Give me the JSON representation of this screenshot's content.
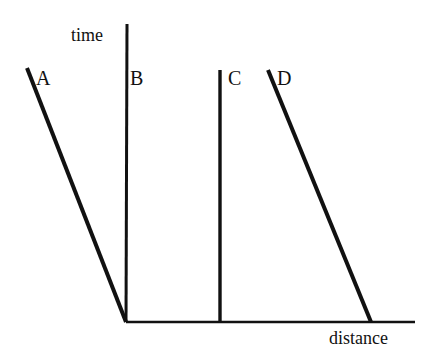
{
  "figure": {
    "background_color": "#ffffff",
    "stroke_color": "#111111",
    "width": 437,
    "height": 363
  },
  "axes": {
    "y_axis_label": "time",
    "x_axis_label": "distance"
  },
  "line_labels": {
    "a": "A",
    "b": "B",
    "c": "C",
    "d": "D"
  },
  "chart_data": {
    "type": "line",
    "title": "",
    "xlabel": "distance",
    "ylabel": "time",
    "grid": false,
    "legend": "inline-endpoint-labels",
    "axis_origin_px": [
      126,
      322
    ],
    "y_axis_top_px": [
      127,
      24
    ],
    "x_axis_right_px": [
      415,
      322
    ],
    "note": "Schematic time-versus-distance worldline diagram; axes are unscaled with no tick marks or numeric labels.",
    "series": [
      {
        "name": "A",
        "label": "A",
        "label_position": "top-left-of-line",
        "start_px": [
          27,
          68
        ],
        "end_px": [
          126,
          322
        ],
        "description": "steep line sloping down-right, terminating at the origin"
      },
      {
        "name": "B",
        "label": "B",
        "label_position": "right-of-line",
        "start_px": [
          127,
          70
        ],
        "end_px": [
          127,
          322
        ],
        "description": "vertical line coincident with the time axis"
      },
      {
        "name": "C",
        "label": "C",
        "label_position": "right-of-line",
        "start_px": [
          220,
          70
        ],
        "end_px": [
          220,
          322
        ],
        "description": "vertical line at a fixed distance"
      },
      {
        "name": "D",
        "label": "D",
        "label_position": "top-right-of-line",
        "start_px": [
          268,
          70
        ],
        "end_px": [
          371,
          322
        ],
        "description": "line sloping down-right, meeting the distance axis"
      }
    ]
  }
}
